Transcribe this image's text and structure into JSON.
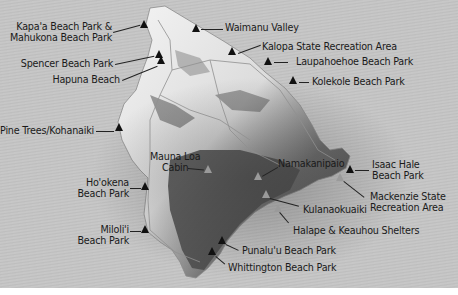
{
  "map": {
    "title": "Big Island campsites",
    "colors": {
      "ocean": "#c4c4c4",
      "marker_dark": "#111111",
      "marker_park": "#9a9a9a",
      "text": "#1a1a1a"
    },
    "labels": {
      "kapaa": "Kapa'a Beach Park &",
      "mahukona": "Mahukona Beach Park",
      "waimanu": "Waimanu Valley",
      "kalopa": "Kalopa State Recreation Area",
      "laupahoehoe": "Laupahoehoe Beach Park",
      "spencer": "Spencer Beach Park",
      "kolekole": "Kolekole Beach Park",
      "hapuna": "Hapuna Beach",
      "pinetrees": "Pine Trees/Kohanaiki",
      "maunaloa_1": "Mauna Loa",
      "maunaloa_2": "Cabin",
      "namakanipaio": "Namakanipaio",
      "isaachale_1": "Isaac Hale",
      "isaachale_2": "Beach Park",
      "hookena_1": "Ho'okena",
      "hookena_2": "Beach Park",
      "mackenzie_1": "Mackenzie State",
      "mackenzie_2": "Recreation Area",
      "kulanaokuaiki": "Kulanaokuaiki",
      "milolii_1": "Miloli'i",
      "milolii_2": "Beach Park",
      "halape": "Halape & Keauhou Shelters",
      "punaluu": "Punalu'u Beach Park",
      "whittington": "Whittington Beach Park"
    },
    "marker_icons": {
      "campsite": "triangle-marker",
      "national_park_campsite": "triangle-marker-gray"
    }
  }
}
